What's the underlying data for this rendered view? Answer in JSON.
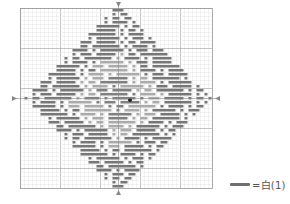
{
  "chart_title": "",
  "grid": {
    "left": 20,
    "top": 8,
    "cols": 48,
    "rows": 45,
    "cell_w": 4,
    "cell_h": 4,
    "major_every": 10,
    "minor_color": "#e4e4e4",
    "major_color": "#b5b5b5",
    "border_color": "#9a9a9a"
  },
  "center_markers": {
    "color": "#888888",
    "center_col": 24,
    "center_row": 22
  },
  "pattern": {
    "shape": "diamond",
    "outer_color": "#777777",
    "inner_ring_color": "#ababab",
    "center_color": "#808080",
    "dot_color": "#222222",
    "dot_position": {
      "x": 130,
      "y": 100
    },
    "outer_radius": 23,
    "inner_ring_outer": 13,
    "inner_ring_inner": 7
  },
  "legend": {
    "symbol": "dark-bar",
    "label": "=白(1)",
    "color": "#6f6f6f"
  }
}
